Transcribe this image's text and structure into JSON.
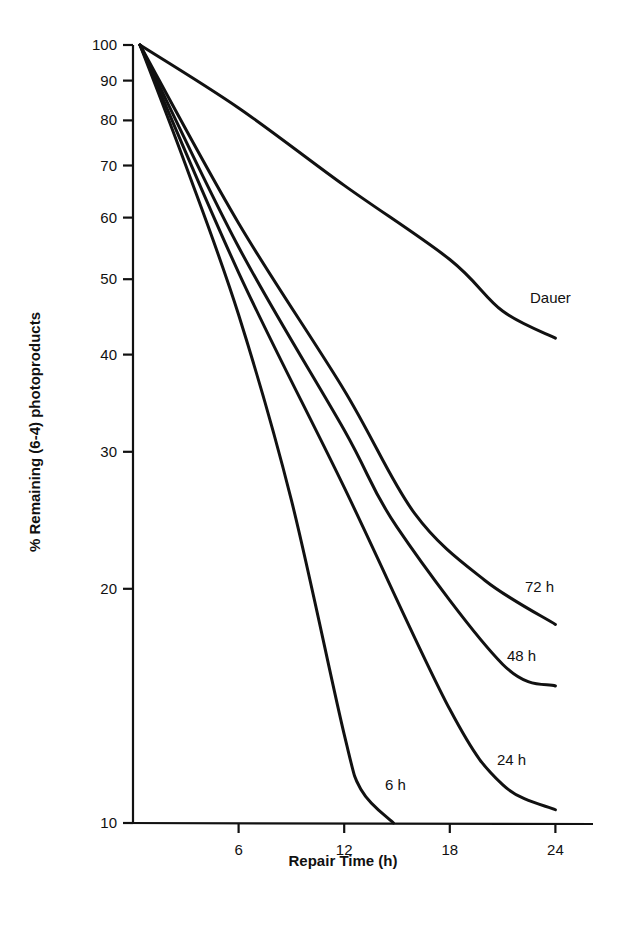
{
  "chart_data": {
    "type": "line",
    "title": "",
    "xlabel": "Repair Time (h)",
    "ylabel": "% Remaining (6-4) photoproducts",
    "x_ticks": [
      6,
      12,
      18,
      24
    ],
    "x_tick_labels": [
      "6",
      "12",
      "18",
      "24"
    ],
    "y_ticks": [
      10,
      20,
      30,
      40,
      50,
      60,
      70,
      80,
      90,
      100
    ],
    "y_tick_labels": [
      "10",
      "20",
      "30",
      "40",
      "50",
      "60",
      "70",
      "80",
      "90",
      "100"
    ],
    "y_scale": "log",
    "xlim": [
      0,
      26
    ],
    "ylim": [
      10,
      100
    ],
    "grid": false,
    "legend": "inline labels at curve ends",
    "series": [
      {
        "name": "Dauer",
        "x": [
          0,
          6,
          12,
          18,
          21,
          24
        ],
        "values": [
          100,
          83,
          66,
          53,
          45.5,
          42
        ]
      },
      {
        "name": "72 h",
        "x": [
          0,
          6,
          12,
          16,
          20,
          24
        ],
        "values": [
          100,
          59,
          36,
          25,
          20.5,
          18
        ]
      },
      {
        "name": "48 h",
        "x": [
          0,
          6,
          12,
          15,
          21,
          24
        ],
        "values": [
          100,
          55,
          32,
          24,
          16,
          15
        ]
      },
      {
        "name": "24 h",
        "x": [
          0,
          6,
          12,
          18,
          21,
          24
        ],
        "values": [
          100,
          51,
          27,
          14,
          11.2,
          10.4
        ]
      },
      {
        "name": "6 h",
        "x": [
          0,
          3,
          6,
          9,
          12,
          13,
          14.8
        ],
        "values": [
          100,
          70,
          45,
          26,
          13,
          11,
          10
        ]
      }
    ],
    "series_label_positions": [
      {
        "name": "Dauer",
        "x": 530,
        "y": 303
      },
      {
        "name": "72 h",
        "x": 525,
        "y": 592
      },
      {
        "name": "48 h",
        "x": 507,
        "y": 661
      },
      {
        "name": "24 h",
        "x": 497,
        "y": 765
      },
      {
        "name": "6 h",
        "x": 385,
        "y": 790
      }
    ]
  }
}
